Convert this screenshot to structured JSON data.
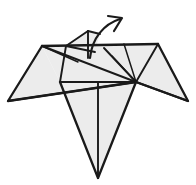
{
  "figure": {
    "background_color": "#ffffff",
    "paper_fill_color": "#e9e9e9",
    "line_color": "#1a1a1a",
    "canvas": {
      "width": 196,
      "height": 185
    }
  },
  "geometry": {
    "key_points": {
      "left_wing_tip": [
        8,
        101
      ],
      "left_shoulder": [
        42,
        46
      ],
      "top_right_corner": [
        158,
        44
      ],
      "right_wing_tip": [
        188,
        101
      ],
      "center_hub": [
        136,
        82
      ],
      "left_mid": [
        60,
        82
      ],
      "body_bottom_tip": [
        98,
        178
      ],
      "head_apex": [
        88,
        31
      ],
      "head_left": [
        66,
        46
      ],
      "head_right": [
        100,
        34
      ]
    },
    "faces": [
      {
        "name": "left-wing-face",
        "points": "8,101 42,46 60,82 136,82"
      },
      {
        "name": "right-wing-face",
        "points": "158,44 188,101 136,82"
      },
      {
        "name": "center-panel-face",
        "points": "42,46 158,44 136,82 60,82"
      },
      {
        "name": "body-triangle-face",
        "points": "60,82 136,82 98,178"
      },
      {
        "name": "head-flap-face",
        "points": "66,46 88,31 100,34 95,50"
      }
    ],
    "creases": [
      {
        "name": "crease-left-shoulder-to-hub",
        "path": "M42,46 L136,82"
      },
      {
        "name": "crease-left-shoulder-to-inner",
        "path": "M42,46 L78,62"
      },
      {
        "name": "crease-left-mid-vertical",
        "path": "M60,82 L66,46"
      },
      {
        "name": "crease-hub-to-top-right",
        "path": "M136,82 L158,44"
      },
      {
        "name": "crease-hub-to-upper-mid",
        "path": "M136,82 L124,44"
      },
      {
        "name": "crease-hub-to-inner-left",
        "path": "M136,82 L112,56"
      },
      {
        "name": "crease-hub-fan-lower",
        "path": "M136,82 L104,48"
      },
      {
        "name": "crease-body-center-vertical",
        "path": "M98,82 L98,178"
      },
      {
        "name": "crease-head-center-vertical",
        "path": "M88,31 L88,58"
      },
      {
        "name": "crease-head-left-edge",
        "path": "M66,46 L88,31"
      },
      {
        "name": "crease-head-right-edge",
        "path": "M88,31 L100,34"
      },
      {
        "name": "crease-head-fold-line",
        "path": "M66,46 L95,52"
      },
      {
        "name": "crease-horizontal-mid",
        "path": "M60,82 L136,82"
      },
      {
        "name": "crease-wing-underline",
        "path": "M8,101 L136,82"
      },
      {
        "name": "crease-right-under",
        "path": "M136,82 L188,101"
      }
    ],
    "outlines": [
      {
        "name": "outline-left-wing",
        "path": "M42,46 L8,101 L136,82"
      },
      {
        "name": "outline-top-edge",
        "path": "M42,46 L158,44"
      },
      {
        "name": "outline-right-wing",
        "path": "M158,44 L188,101 L136,82"
      },
      {
        "name": "outline-body",
        "path": "M60,82 L98,178 L136,82"
      }
    ]
  },
  "annotation": {
    "arrow": {
      "name": "fold-direction-arrow",
      "meaning": "rotate / fold head flap upward and to the right",
      "shaft_path": "M90,58 C92,38 104,24 120,19",
      "head_path": "M108,16 L122,18 L114,31",
      "color": "#1a1a1a"
    }
  },
  "labels": {
    "step_number": "",
    "caption": ""
  }
}
